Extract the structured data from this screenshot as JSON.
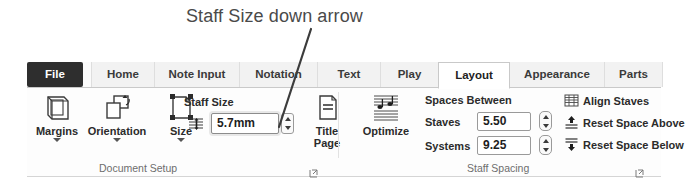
{
  "annotation": {
    "text": "Staff Size down arrow",
    "pointer": "callout-line"
  },
  "ribbon": {
    "tabs": [
      {
        "label": "File",
        "state": "file"
      },
      {
        "label": "Home",
        "state": "inactive"
      },
      {
        "label": "Note Input",
        "state": "inactive"
      },
      {
        "label": "Notation",
        "state": "inactive"
      },
      {
        "label": "Text",
        "state": "inactive"
      },
      {
        "label": "Play",
        "state": "inactive"
      },
      {
        "label": "Layout",
        "state": "active"
      },
      {
        "label": "Appearance",
        "state": "inactive"
      },
      {
        "label": "Parts",
        "state": "inactive"
      }
    ],
    "groups": {
      "document_setup": {
        "label": "Document Setup",
        "buttons": [
          {
            "label": "Margins",
            "icon": "margins-icon",
            "has_menu": true
          },
          {
            "label": "Orientation",
            "icon": "orientation-icon",
            "has_menu": true
          },
          {
            "label": "Size",
            "icon": "page-size-icon",
            "has_menu": true
          },
          {
            "label": "Title\nPage",
            "line1": "Title",
            "line2": "Page",
            "icon": "title-page-icon",
            "has_menu": false
          }
        ],
        "staff_size": {
          "label": "Staff Size",
          "icon": "staff-size-icon",
          "value": "5.7mm",
          "stepper_up": "increase",
          "stepper_down": "decrease"
        },
        "launcher": "dialog-launcher-icon"
      },
      "staff_spacing": {
        "label": "Staff Spacing",
        "optimize": {
          "label": "Optimize",
          "icon": "optimize-icon"
        },
        "spaces_between_label": "Spaces Between",
        "fields": [
          {
            "label": "Staves",
            "value": "5.50"
          },
          {
            "label": "Systems",
            "value": "9.25"
          }
        ],
        "commands": [
          {
            "label": "Align Staves",
            "icon": "align-staves-icon"
          },
          {
            "label": "Reset Space Above",
            "icon": "reset-space-above-icon"
          },
          {
            "label": "Reset Space Below",
            "icon": "reset-space-below-icon"
          }
        ],
        "launcher": "dialog-launcher-icon"
      }
    }
  }
}
